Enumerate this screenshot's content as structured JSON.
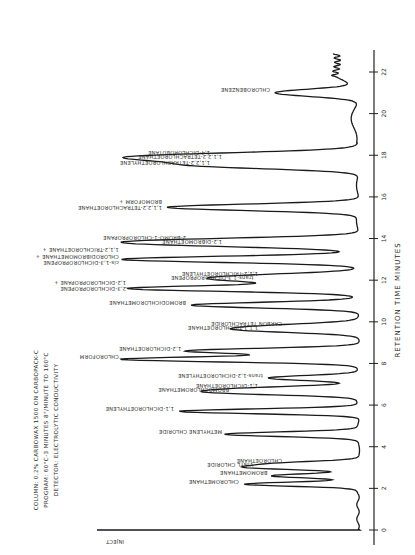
{
  "chart_data": {
    "type": "line",
    "title": "",
    "orientation": "rotated-90",
    "xlabel": "RETENTION TIME  MINUTES",
    "ylabel": "Detector response",
    "xlim": [
      0,
      23
    ],
    "x_ticks": [
      0,
      2,
      4,
      6,
      8,
      10,
      12,
      14,
      16,
      18,
      20,
      22
    ],
    "grid": false,
    "conditions": [
      "COLUMN: 0.2% CARBOWAX 1500  ON CARBOPACK-C",
      "PROGRAM:  60°C-3 MINUTES 8°/MINUTE TO 160°C",
      "DETECTOR:  ELECTROLYTIC CONDUCTIVITY"
    ],
    "inject_label": "INJECT",
    "peaks": [
      {
        "t": 2.2,
        "h": 0.48,
        "label": "CHLOROMETHANE"
      },
      {
        "t": 2.6,
        "h": 0.36,
        "label": "BROMOMETHANE"
      },
      {
        "t": 3.0,
        "h": 0.42,
        "label": "VINYL CHLORIDE"
      },
      {
        "t": 3.2,
        "h": 0.3,
        "label": "CHLOROETHANE"
      },
      {
        "t": 4.6,
        "h": 0.55,
        "label": "METHYLENE CHLORIDE"
      },
      {
        "t": 5.7,
        "h": 0.75,
        "label": "1,1-DICHLOROETHYLENE"
      },
      {
        "t": 6.6,
        "h": 0.52,
        "label": "BROMOCHLOROMETHANE"
      },
      {
        "t": 6.8,
        "h": 0.4,
        "label": "1,1-DICHLOROETHANE"
      },
      {
        "t": 7.3,
        "h": 0.38,
        "label": "trans-1,2-DICHLOROETHYLENE"
      },
      {
        "t": 8.2,
        "h": 0.98,
        "label": "CHLOROFORM"
      },
      {
        "t": 8.6,
        "h": 0.72,
        "label": "1,2-DICHLOROETHANE"
      },
      {
        "t": 9.6,
        "h": 0.4,
        "label": "1,1,1-TRICHLOROETHANE"
      },
      {
        "t": 9.8,
        "h": 0.3,
        "label": "CARBON TETRACHLORIDE"
      },
      {
        "t": 10.8,
        "h": 0.7,
        "label": "BROMODICHLOROMETHANE"
      },
      {
        "t": 11.6,
        "h": 0.95,
        "label": "1,2-DICHLOROPROPANE + 2,3-DICHLOROPROPENE"
      },
      {
        "t": 12.0,
        "h": 0.42,
        "label": "trans-1,3-DICHLOROPROPENE"
      },
      {
        "t": 12.2,
        "h": 0.4,
        "label": "1,1,2-TRICHLOROETHYLENE"
      },
      {
        "t": 13.0,
        "h": 0.98,
        "label": "1,1,2-TRICHLOROETHANE + CHLORODIBROMOMETHANE + cis-1,3-DICHLOROPROPENE"
      },
      {
        "t": 13.7,
        "h": 0.55,
        "label": "1,2-DIBROMOETHANE"
      },
      {
        "t": 13.9,
        "h": 0.7,
        "label": "2-BROMO-1-CHLOROPROPANE"
      },
      {
        "t": 15.5,
        "h": 0.8,
        "label": "BROMOFORM + 1,1,2,2-TETRACHLOROETHANE"
      },
      {
        "t": 17.5,
        "h": 0.6,
        "label": "1,1,2,2-TETRACHLOROETHYLENE"
      },
      {
        "t": 17.8,
        "h": 0.55,
        "label": "1,1,2,2-TETRACHLOROETHANE"
      },
      {
        "t": 18.0,
        "h": 0.6,
        "label": "1,4-DICHLOROBUTANE"
      },
      {
        "t": 21.0,
        "h": 0.35,
        "label": "CHLOROBENZENE"
      }
    ]
  }
}
